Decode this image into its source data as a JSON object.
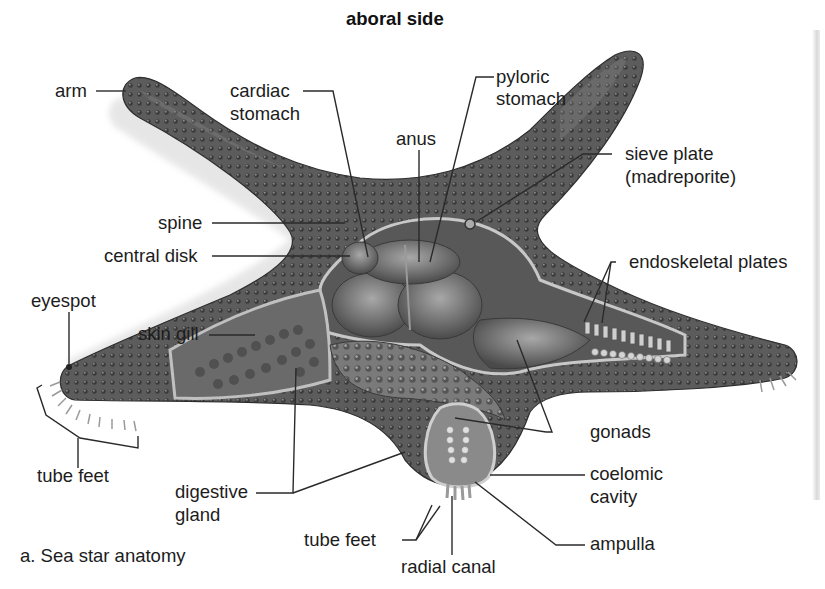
{
  "diagram": {
    "title": "aboral side",
    "caption": "a. Sea star anatomy",
    "colors": {
      "body_dark": "#4a4a4a",
      "body_mid": "#6e6e6e",
      "body_light": "#9a9a9a",
      "cut_surface": "#b5b5b5",
      "organ": "#7d7d7d",
      "leader_line": "#2a2a2a",
      "background": "#ffffff"
    },
    "labels": {
      "arm": "arm",
      "cardiac_1": "cardiac",
      "cardiac_2": "stomach",
      "pyloric_1": "pyloric",
      "pyloric_2": "stomach",
      "anus": "anus",
      "sieve_1": "sieve plate",
      "sieve_2": "(madreporite)",
      "spine": "spine",
      "central_disk": "central disk",
      "endoskeletal": "endoskeletal plates",
      "eyespot": "eyespot",
      "skin_gill": "skin gill",
      "tube_feet_left": "tube feet",
      "digestive_1": "digestive",
      "digestive_2": "gland",
      "gonads": "gonads",
      "coelomic_1": "coelomic",
      "coelomic_2": "cavity",
      "tube_feet_bottom": "tube feet",
      "ampulla": "ampulla",
      "radial_canal": "radial canal"
    }
  }
}
